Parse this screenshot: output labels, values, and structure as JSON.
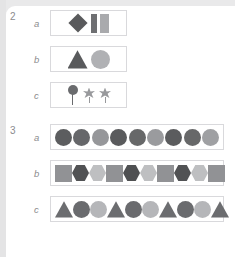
{
  "worksheet": {
    "title": "Shape pattern worksheet",
    "background_color": "#e9e9ea",
    "card_color": "#ffffff",
    "box_border_color": "#d9d9dc",
    "label_color": "#8c8c8e",
    "palette": {
      "dark": "#595a5c",
      "mid": "#7d7e81",
      "light": "#b3b4b7",
      "pale": "#c9cacc"
    }
  },
  "groups": [
    {
      "number": "2",
      "rows": [
        {
          "letter": "a",
          "box": "narrow",
          "shapes": [
            {
              "type": "diamond",
              "color": "#595a5c",
              "size": "md"
            },
            {
              "type": "rectangle-narrow",
              "color": "#6e6f72",
              "size": "md"
            },
            {
              "type": "rectangle-wide",
              "color": "#a9aaad",
              "size": "md"
            }
          ]
        },
        {
          "letter": "b",
          "box": "narrow",
          "shapes": [
            {
              "type": "triangle",
              "color": "#595a5c",
              "size": "lg"
            },
            {
              "type": "circle",
              "color": "#b0b1b4",
              "size": "lg"
            }
          ]
        },
        {
          "letter": "c",
          "box": "narrow",
          "shapes": [
            {
              "type": "pin",
              "color": "#6a6b6e",
              "size": "md"
            },
            {
              "type": "star",
              "color": "#98999c",
              "size": "md"
            },
            {
              "type": "star",
              "color": "#98999c",
              "size": "md"
            }
          ]
        }
      ]
    },
    {
      "number": "3",
      "rows": [
        {
          "letter": "a",
          "box": "wide",
          "shapes": [
            {
              "type": "circle",
              "color": "#5c5d5f",
              "size": "md"
            },
            {
              "type": "circle",
              "color": "#66676a",
              "size": "md"
            },
            {
              "type": "circle",
              "color": "#96979a",
              "size": "md"
            },
            {
              "type": "circle",
              "color": "#5a5b5d",
              "size": "md"
            },
            {
              "type": "circle",
              "color": "#676869",
              "size": "md"
            },
            {
              "type": "circle",
              "color": "#9a9b9e",
              "size": "md"
            },
            {
              "type": "circle",
              "color": "#5b5c5e",
              "size": "md"
            },
            {
              "type": "circle",
              "color": "#676869",
              "size": "md"
            },
            {
              "type": "circle",
              "color": "#9fa0a3",
              "size": "md"
            }
          ]
        },
        {
          "letter": "b",
          "box": "wide",
          "shapes": [
            {
              "type": "square",
              "color": "#919295",
              "size": "md"
            },
            {
              "type": "hexagon",
              "color": "#515254",
              "size": "md"
            },
            {
              "type": "hexagon",
              "color": "#bebfc1",
              "size": "md"
            },
            {
              "type": "square",
              "color": "#919295",
              "size": "md"
            },
            {
              "type": "hexagon",
              "color": "#4f5052",
              "size": "md"
            },
            {
              "type": "hexagon",
              "color": "#bebfc1",
              "size": "md"
            },
            {
              "type": "square",
              "color": "#919295",
              "size": "md"
            },
            {
              "type": "hexagon",
              "color": "#515254",
              "size": "md"
            },
            {
              "type": "hexagon",
              "color": "#bebfc1",
              "size": "md"
            },
            {
              "type": "square",
              "color": "#919295",
              "size": "md"
            }
          ]
        },
        {
          "letter": "c",
          "box": "wide",
          "shapes": [
            {
              "type": "triangle",
              "color": "#6c6d70",
              "size": "md"
            },
            {
              "type": "circle",
              "color": "#6a6b6e",
              "size": "md"
            },
            {
              "type": "circle",
              "color": "#b5b6b9",
              "size": "md"
            },
            {
              "type": "triangle",
              "color": "#6c6d70",
              "size": "md"
            },
            {
              "type": "circle",
              "color": "#6a6b6e",
              "size": "md"
            },
            {
              "type": "circle",
              "color": "#b5b6b9",
              "size": "md"
            },
            {
              "type": "triangle",
              "color": "#6c6d70",
              "size": "md"
            },
            {
              "type": "circle",
              "color": "#6a6b6e",
              "size": "md"
            },
            {
              "type": "circle",
              "color": "#b5b6b9",
              "size": "md"
            },
            {
              "type": "triangle",
              "color": "#6c6d70",
              "size": "md"
            }
          ]
        }
      ]
    }
  ]
}
